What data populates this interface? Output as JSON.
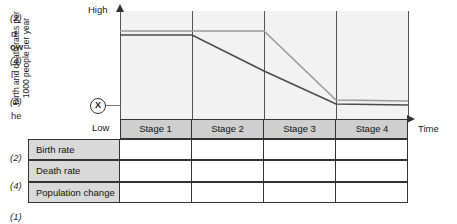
{
  "margin": {
    "marks": [
      {
        "text": "(2)",
        "top": 12
      },
      {
        "text": "(4)",
        "top": 55
      },
      {
        "text": "(2)",
        "top": 96
      },
      {
        "text": "(2)",
        "top": 152
      },
      {
        "text": "(4)",
        "top": 180
      },
      {
        "text": "(1)",
        "top": 211
      }
    ],
    "clipped_text": [
      {
        "text": "rt",
        "top": 28,
        "bold": false
      },
      {
        "text": "ow",
        "top": 41,
        "bold": true
      },
      {
        "text": "l",
        "top": 69,
        "bold": false
      },
      {
        "text": "he",
        "top": 110,
        "bold": false
      }
    ]
  },
  "chart": {
    "y_axis_label": "Birth and death rates per\n1000 people per year",
    "y_axis_label_line1": "Birth and death rates per",
    "y_axis_label_line2": "1000 people per year",
    "y_high_label": "High",
    "y_low_label": "Low",
    "x_axis_label": "Time",
    "origin_marker": "X",
    "stages": [
      "Stage 1",
      "Stage 2",
      "Stage 3",
      "Stage 4"
    ]
  },
  "table": {
    "rows": [
      {
        "label": "Birth rate",
        "cells": [
          "",
          "",
          "",
          ""
        ]
      },
      {
        "label": "Death rate",
        "cells": [
          "",
          "",
          "",
          ""
        ]
      },
      {
        "label": "Population change",
        "cells": [
          "",
          "",
          "",
          ""
        ]
      }
    ]
  },
  "colors": {
    "birth_rate_line": "#9a9a9a",
    "death_rate_line": "#4a4a4a",
    "plot_background": "#f2f2f2",
    "stage_band": "#cfcfcf",
    "table_label_background": "#d9d9d9",
    "axis": "#555555"
  },
  "chart_data": {
    "type": "line",
    "xlabel": "Time",
    "ylabel": "Birth and death rates per 1000 people per year",
    "ylim_labels": [
      "Low",
      "High"
    ],
    "grid": false,
    "legend": "none",
    "categories": [
      "Stage 1",
      "Stage 2",
      "Stage 3",
      "Stage 4"
    ],
    "stage_boundaries_px": [
      120,
      192,
      264,
      336,
      408
    ],
    "series": [
      {
        "name": "Birth rate",
        "color": "#9a9a9a",
        "points": [
          {
            "x": 120,
            "y": 31
          },
          {
            "x": 192,
            "y": 31
          },
          {
            "x": 264,
            "y": 31
          },
          {
            "x": 336,
            "y": 100
          },
          {
            "x": 408,
            "y": 101
          }
        ],
        "description": "High and stable through Stages 1 and 2, falls steeply through Stage 3, low and stable in Stage 4"
      },
      {
        "name": "Death rate",
        "color": "#4a4a4a",
        "points": [
          {
            "x": 120,
            "y": 35
          },
          {
            "x": 192,
            "y": 35
          },
          {
            "x": 264,
            "y": 71
          },
          {
            "x": 336,
            "y": 104
          },
          {
            "x": 408,
            "y": 105
          }
        ],
        "description": "High and stable in Stage 1, falls steadily through Stages 2 and 3, low and stable in Stage 4"
      }
    ]
  }
}
